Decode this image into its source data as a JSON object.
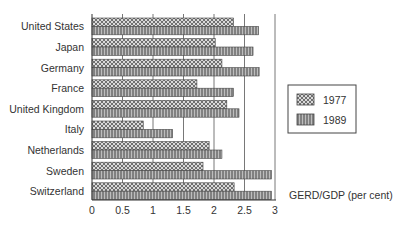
{
  "chart_data": {
    "type": "bar",
    "orientation": "horizontal",
    "title": "",
    "xlabel": "GERD/GDP (per cent)",
    "ylabel": "",
    "xlim": [
      0,
      3
    ],
    "xticks": [
      "0",
      "0.5",
      "1",
      "1.5",
      "2",
      "2.5",
      "3"
    ],
    "grid": true,
    "legend_position": "right",
    "categories": [
      "United States",
      "Japan",
      "Germany",
      "France",
      "United Kingdom",
      "Italy",
      "Netherlands",
      "Sweden",
      "Switzerland"
    ],
    "series": [
      {
        "name": "1977",
        "pattern": "crosshatch",
        "values": [
          2.32,
          2.02,
          2.13,
          1.72,
          2.21,
          0.84,
          1.92,
          1.82,
          2.33
        ]
      },
      {
        "name": "1989",
        "pattern": "vertical-lines",
        "values": [
          2.73,
          2.64,
          2.74,
          2.32,
          2.41,
          1.32,
          2.13,
          2.94,
          2.94
        ]
      }
    ]
  },
  "legend": {
    "items": [
      "1977",
      "1989"
    ]
  },
  "axis": {
    "xlabel": "GERD/GDP (per cent)"
  }
}
